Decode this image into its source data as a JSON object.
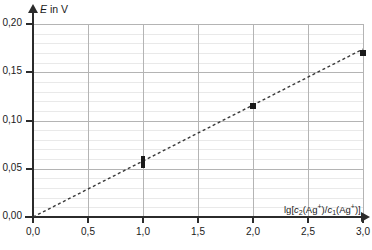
{
  "chart_data": {
    "type": "scatter",
    "title": "",
    "xlabel": "lg[c2(Ag+)/c1(Ag+)]",
    "ylabel": "E in V",
    "xlim": [
      0.0,
      3.0
    ],
    "ylim": [
      0.0,
      0.2
    ],
    "grid": true,
    "legend": "none",
    "x_tick_labels": [
      "0,0",
      "0,5",
      "1,0",
      "1,5",
      "2,0",
      "2,5",
      "3,0"
    ],
    "x_tick_values": [
      0.0,
      0.5,
      1.0,
      1.5,
      2.0,
      2.5,
      3.0
    ],
    "y_tick_labels": [
      "0,00",
      "0,05",
      "0,10",
      "0,15",
      "0,20"
    ],
    "y_tick_values": [
      0.0,
      0.05,
      0.1,
      0.15,
      0.2
    ],
    "y_minor_step": 0.01,
    "points": [
      {
        "x": 1.0,
        "y": 0.057
      },
      {
        "x": 2.0,
        "y": 0.115
      },
      {
        "x": 3.0,
        "y": 0.17
      }
    ],
    "series": [
      {
        "name": "Messwerte",
        "x": [
          1.0,
          2.0,
          3.0
        ],
        "values": [
          0.057,
          0.115,
          0.17
        ]
      }
    ],
    "trendline": {
      "style": "dashed",
      "x_start": 0.0,
      "y_start": 0.0,
      "x_end": 3.0,
      "y_end": 0.174,
      "slope": 0.058,
      "intercept": 0.0
    },
    "colors": {
      "point": "#1a1a1a",
      "trendline": "#3a3a3a",
      "axis": "#2b2b2b",
      "grid_major": "#b4b4b4",
      "grid_minor": "#e9e9e9"
    }
  },
  "axis_title_parts": {
    "y_symbol": "E",
    "y_rest": " in V",
    "x_lg": "lg[",
    "x_c2": "c",
    "x_sub2": "2",
    "x_ag1": "(Ag",
    "x_plus1": "+",
    "x_slash": ")/",
    "x_c1": "c",
    "x_sub1": "1",
    "x_ag2": "(Ag",
    "x_plus2": "+",
    "x_close": ")]"
  }
}
